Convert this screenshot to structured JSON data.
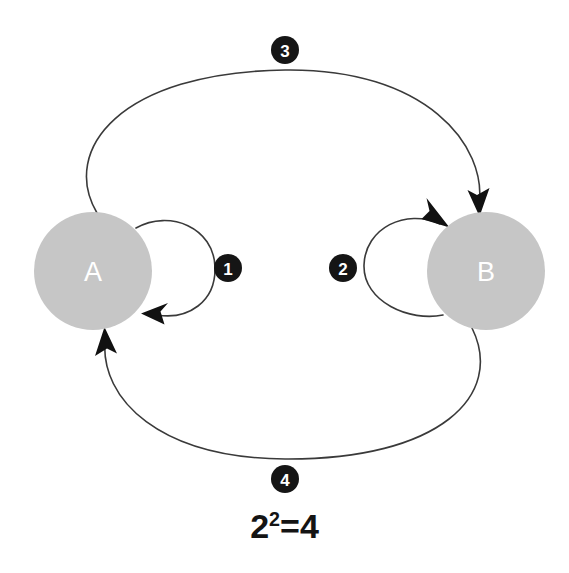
{
  "diagram": {
    "type": "directed-graph",
    "title": "",
    "background_color": "#ffffff",
    "node_fill_color": "#c6c6c6",
    "node_label_color": "#ffffff",
    "edge_color": "#3a3a3a",
    "badge_fill_color": "#151515",
    "badge_label_color": "#ffffff",
    "nodes": [
      {
        "id": "A",
        "label": "A",
        "cx": 93,
        "cy": 271,
        "r": 59
      },
      {
        "id": "B",
        "label": "B",
        "cx": 486,
        "cy": 271,
        "r": 59
      }
    ],
    "edges": [
      {
        "id": "e1",
        "badge": "1",
        "from": "A",
        "to": "A",
        "kind": "self-loop",
        "badge_x": 228,
        "badge_y": 268
      },
      {
        "id": "e2",
        "badge": "2",
        "from": "B",
        "to": "B",
        "kind": "self-loop",
        "badge_x": 343,
        "badge_y": 268
      },
      {
        "id": "e3",
        "badge": "3",
        "from": "A",
        "to": "B",
        "kind": "arc-top",
        "badge_x": 285,
        "badge_y": 50
      },
      {
        "id": "e4",
        "badge": "4",
        "from": "B",
        "to": "A",
        "kind": "arc-bottom",
        "badge_x": 285,
        "badge_y": 479
      }
    ],
    "formula": {
      "base": "2",
      "exponent": "2",
      "equals": "=",
      "result": "4",
      "text": "2²=4"
    }
  }
}
